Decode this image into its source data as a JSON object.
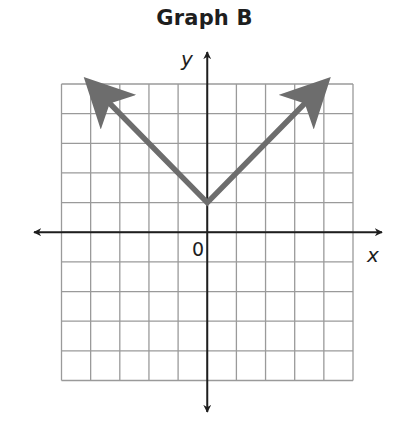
{
  "chart_data": {
    "type": "line",
    "title": "Graph B",
    "xlabel": "x",
    "ylabel": "y",
    "origin_label": "0",
    "grid": true,
    "xlim": [
      -5,
      5
    ],
    "ylim": [
      -5,
      5
    ],
    "grid_step": 1,
    "tick_labels": [],
    "series": [
      {
        "name": "y = |x| + 1",
        "points": [
          [
            -4,
            5
          ],
          [
            0,
            1
          ],
          [
            4,
            5
          ]
        ],
        "arrows_at_ends": true,
        "color": "#6d6d6d"
      }
    ]
  },
  "colors": {
    "grid": "#9a9a9a",
    "axis": "#1e1e1e",
    "line": "#6d6d6d"
  }
}
